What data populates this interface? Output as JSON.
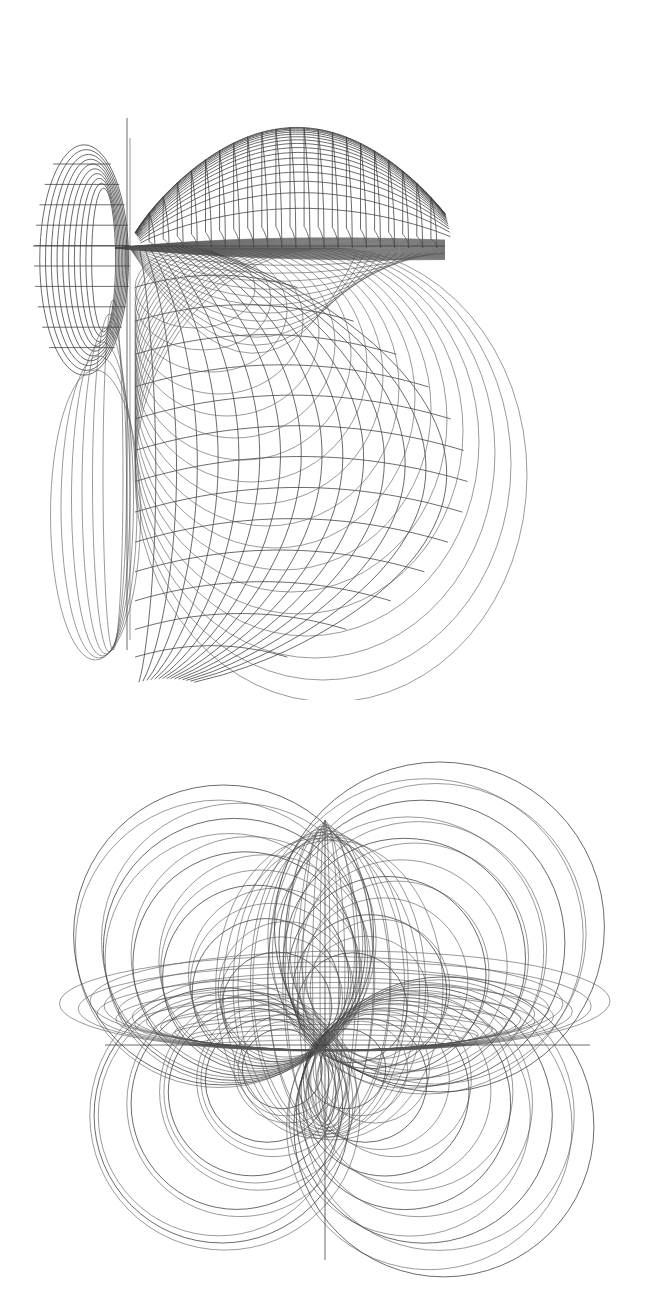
{
  "figures": [
    {
      "id": "top-figure",
      "description": "wireframe surface of nested teardrop lobes with meridian and parallel grid lines",
      "line_color": "#3c3c3c",
      "background": "#ffffff",
      "bbox": {
        "x": 0,
        "y": 0,
        "w": 659,
        "h": 700
      },
      "upper_lobe": {
        "cx": 290,
        "cy": 160,
        "rx": 155,
        "ry": 115,
        "pinch_y": 248,
        "tip_x": 135,
        "meridians": 22,
        "parallels": 18
      },
      "lower_lobe": {
        "cx": 300,
        "cy": 450,
        "rx": 175,
        "ry": 230,
        "meridians": 16,
        "parallels": 14
      },
      "left_lobe": {
        "cx": 82,
        "cy": 260,
        "rx": 48,
        "ry": 120,
        "rings": 10
      },
      "left_loops": {
        "x": 90,
        "top": 300,
        "bottom": 650,
        "count": 6
      },
      "stem": {
        "x": 127,
        "y1": 118,
        "y2": 650
      }
    },
    {
      "id": "bottom-figure",
      "description": "four-lobed butterfly of overlapping circles and ellipses",
      "line_color": "#3c3c3c",
      "background": "#ffffff",
      "bbox": {
        "x": 0,
        "y": 700,
        "w": 659,
        "h": 605
      },
      "center": {
        "x": 325,
        "y": 1040
      },
      "lobes": [
        {
          "name": "upper-left",
          "cx": 215,
          "cy": 920,
          "rmin": 55,
          "rmax": 150,
          "count": 16
        },
        {
          "name": "upper-right",
          "cx": 450,
          "cy": 910,
          "rmin": 55,
          "rmax": 165,
          "count": 16
        },
        {
          "name": "lower-left",
          "cx": 215,
          "cy": 1125,
          "rmin": 40,
          "rmax": 135,
          "count": 14
        },
        {
          "name": "lower-right",
          "cx": 455,
          "cy": 1140,
          "rmin": 40,
          "rmax": 150,
          "count": 16
        }
      ],
      "horizontal_ellipses": {
        "cx": 330,
        "cy": 1045,
        "rx_min": 120,
        "rx_max": 260,
        "ry_min": 5,
        "ry_max": 80,
        "count": 18
      },
      "vertical_ellipses": {
        "cx": 325,
        "cy": 1000,
        "rx_min": 5,
        "rx_max": 110,
        "ry": 150,
        "count": 14
      }
    }
  ]
}
